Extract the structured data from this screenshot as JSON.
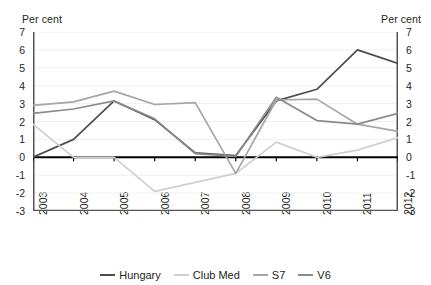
{
  "axis_unit_left": "Per cent",
  "axis_unit_right": "Per cent",
  "legend": [
    {
      "label": "Hungary",
      "color": "#4d4d4d"
    },
    {
      "label": "Club Med",
      "color": "#cfcfcf"
    },
    {
      "label": "S7",
      "color": "#a6a6a6"
    },
    {
      "label": "V6",
      "color": "#8a8a8a"
    }
  ],
  "chart_data": {
    "type": "line",
    "title": "",
    "xlabel": "",
    "ylabel": "Per cent",
    "ylim": [
      -3,
      7
    ],
    "yticks": [
      7,
      6,
      5,
      4,
      3,
      2,
      1,
      0,
      -1,
      -2,
      -3
    ],
    "ytick_labels": [
      "7",
      "6",
      "5",
      "4",
      "3",
      "2",
      "1",
      "0",
      "-1",
      "-2",
      "-3"
    ],
    "grid": true,
    "legend_position": "bottom",
    "categories": [
      "2003",
      "2004",
      "2005",
      "2006",
      "2007",
      "2008",
      "2009",
      "2010",
      "2011",
      "2012"
    ],
    "series": [
      {
        "name": "Hungary",
        "color": "#4d4d4d",
        "values": [
          0.0,
          1.0,
          3.15,
          2.1,
          0.25,
          0.1,
          3.15,
          3.8,
          6.0,
          5.25
        ]
      },
      {
        "name": "Club Med",
        "color": "#cfcfcf",
        "values": [
          1.85,
          0.0,
          0.0,
          -1.9,
          -1.4,
          -0.9,
          0.85,
          0.0,
          0.4,
          1.1
        ]
      },
      {
        "name": "S7",
        "color": "#a6a6a6",
        "values": [
          2.9,
          3.1,
          3.7,
          2.95,
          3.05,
          -0.9,
          3.2,
          3.25,
          1.85,
          1.45
        ]
      },
      {
        "name": "V6",
        "color": "#8a8a8a",
        "values": [
          2.45,
          2.7,
          3.15,
          2.15,
          0.2,
          0.05,
          3.35,
          2.05,
          1.85,
          2.45
        ]
      }
    ]
  }
}
